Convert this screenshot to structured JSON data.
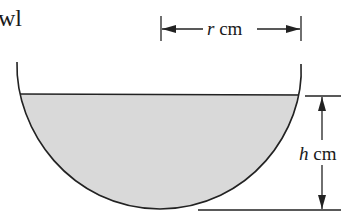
{
  "diagram": {
    "type": "hemispherical bowl cross-section with water",
    "corner_text": "wl",
    "radius_label": {
      "var": "r",
      "unit": " cm"
    },
    "height_label": {
      "var": "h",
      "unit": " cm"
    },
    "colors": {
      "stroke": "#222222",
      "water_fill": "#d9d9d9",
      "background": "#ffffff"
    }
  }
}
